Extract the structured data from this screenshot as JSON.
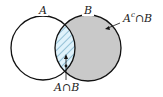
{
  "diagram": {
    "type": "venn",
    "sets": [
      {
        "name": "A",
        "label": "A"
      },
      {
        "name": "B",
        "label": "B"
      }
    ],
    "regions": [
      {
        "name": "A-intersect-B",
        "label": "A∩B",
        "fill": "hatched",
        "color": "#dff2fb"
      },
      {
        "name": "A-complement-intersect-B",
        "label": "Aᶜ∩B",
        "fill": "gray",
        "color": "#c9c9c9"
      }
    ]
  },
  "labels": {
    "set_a": "A",
    "set_b": "B",
    "intersection": "A∩B",
    "complement_intersection_base": "A",
    "complement_intersection_sup": "c",
    "complement_intersection_rest": "∩B"
  }
}
